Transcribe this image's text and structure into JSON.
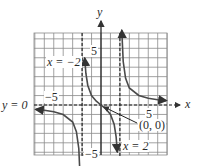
{
  "chart_data": {
    "type": "line",
    "title": "",
    "xlabel": "x",
    "ylabel": "y",
    "xlim": [
      -7,
      7
    ],
    "ylim": [
      -5.3,
      7.5
    ],
    "grid": true,
    "function": "f(x) = 3x/(x^2 - 4)",
    "tick_labels": {
      "x": [
        "-5",
        "5"
      ],
      "y": [
        "5",
        "-5"
      ]
    },
    "asymptotes": {
      "vertical": [
        {
          "x": -2,
          "label": "x = -2"
        },
        {
          "x": 2,
          "label": "x = 2"
        }
      ],
      "horizontal": [
        {
          "y": 0,
          "label": "y = 0"
        }
      ]
    },
    "annotations": [
      {
        "point": [
          0,
          0
        ],
        "label": "(0, 0)"
      }
    ],
    "series": [
      {
        "name": "left-branch",
        "x": [
          -6.9,
          -6,
          -5,
          -4,
          -3,
          -2.6,
          -2.35,
          -2.2
        ],
        "y": [
          -0.47,
          -0.56,
          -0.71,
          -1.0,
          -1.8,
          -2.83,
          -4.6,
          -7.9
        ]
      },
      {
        "name": "middle-branch",
        "x": [
          -1.72,
          -1.6,
          -1.4,
          -1,
          -0.5,
          0,
          0.5,
          1,
          1.4,
          1.6,
          1.72
        ],
        "y": [
          4.95,
          3.33,
          2.06,
          1.0,
          0.4,
          0,
          -0.4,
          -1.0,
          -2.06,
          -3.33,
          -4.95
        ]
      },
      {
        "name": "right-branch",
        "x": [
          2.2,
          2.35,
          2.6,
          3,
          4,
          5,
          6,
          6.9
        ],
        "y": [
          7.9,
          4.6,
          2.83,
          1.8,
          1.0,
          0.71,
          0.56,
          0.47
        ]
      }
    ]
  },
  "labels": {
    "y_axis": "y",
    "x_axis": "x",
    "asym_left": "x = −2",
    "asym_right": "x = 2",
    "asym_horizontal": "y = 0",
    "tick_y_pos": "5",
    "tick_y_neg": "−5",
    "tick_x_neg": "−5",
    "tick_x_pos": "5",
    "origin": "(0, 0)"
  },
  "colors": {
    "grid": "#8a8a8a",
    "axis": "#1a1a1a",
    "curve": "#4a4a4a"
  }
}
